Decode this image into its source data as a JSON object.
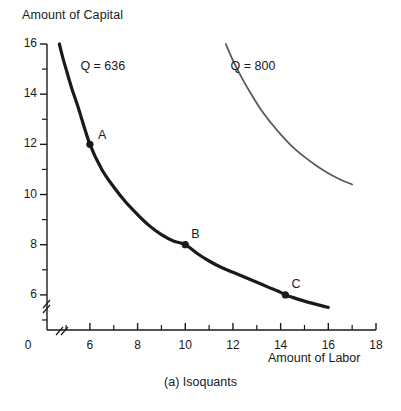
{
  "figure": {
    "caption": "(a) Isoquants",
    "background_color": "#ffffff",
    "ink_color": "#1a1a1a"
  },
  "chart_data": {
    "type": "line",
    "title": "",
    "subtitle": "",
    "caption": "(a) Isoquants",
    "xlabel": "Amount of Labor",
    "ylabel": "Amount of Capital",
    "xlim": [
      4.2,
      18
    ],
    "ylim": [
      4.6,
      16
    ],
    "grid": false,
    "legend_position": "inline-curve-labels",
    "axis_break": {
      "x_axis": true,
      "y_axis": true,
      "note": "hash marks near origin on both axes"
    },
    "x_major_ticks": [
      6,
      8,
      10,
      12,
      14,
      16,
      18
    ],
    "x_minor_ticks": [
      5,
      7,
      9,
      11,
      13,
      15,
      17
    ],
    "x_tick_labels": [
      "6",
      "8",
      "10",
      "12",
      "14",
      "16",
      "18"
    ],
    "x_origin_label": "0",
    "y_major_ticks": [
      6,
      8,
      10,
      12,
      14,
      16
    ],
    "y_minor_ticks": [
      5,
      7,
      9,
      11,
      13,
      15
    ],
    "y_tick_labels": [
      "6",
      "8",
      "10",
      "12",
      "14",
      "16"
    ],
    "series": [
      {
        "name": "Q = 636",
        "label": "Q = 636",
        "color": "#1a1a1a",
        "line_width": 3.2,
        "label_x": 5.6,
        "label_y": 15.1,
        "x": [
          4.72,
          4.85,
          5.0,
          5.25,
          5.5,
          6.0,
          6.5,
          7.0,
          7.5,
          8.0,
          8.5,
          9.0,
          9.5,
          10.0,
          10.5,
          11.0,
          11.5,
          12.0,
          12.5,
          13.0,
          13.5,
          14.0,
          14.2,
          14.5,
          15.0,
          15.5,
          16.0
        ],
        "y": [
          16.0,
          15.5,
          15.0,
          14.2,
          13.5,
          12.0,
          11.0,
          10.3,
          9.7,
          9.2,
          8.75,
          8.4,
          8.15,
          8.0,
          7.65,
          7.35,
          7.1,
          6.9,
          6.7,
          6.5,
          6.3,
          6.1,
          6.0,
          5.9,
          5.75,
          5.62,
          5.5
        ]
      },
      {
        "name": "Q = 800",
        "label": "Q = 800",
        "color": "#5a5a5a",
        "line_width": 1.8,
        "label_x": 11.9,
        "label_y": 15.1,
        "x": [
          11.7,
          12.0,
          12.4,
          12.8,
          13.2,
          13.6,
          14.0,
          14.5,
          15.0,
          15.5,
          16.0,
          16.5,
          17.0
        ],
        "y": [
          16.0,
          15.35,
          14.6,
          13.95,
          13.35,
          12.85,
          12.4,
          11.9,
          11.5,
          11.15,
          10.85,
          10.6,
          10.4
        ]
      }
    ],
    "points": [
      {
        "label": "A",
        "x": 6.0,
        "y": 12.0,
        "series": "Q = 636",
        "label_dx": 8,
        "label_dy": -8
      },
      {
        "label": "B",
        "x": 10.0,
        "y": 8.0,
        "series": "Q = 636",
        "label_dx": 6,
        "label_dy": -10
      },
      {
        "label": "C",
        "x": 14.2,
        "y": 6.0,
        "series": "Q = 636",
        "label_dx": 6,
        "label_dy": -10
      }
    ]
  }
}
